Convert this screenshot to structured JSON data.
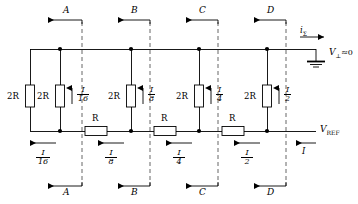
{
  "figure": {
    "type": "circuit-schematic",
    "name": "R-2R ladder network",
    "background": "#ffffff",
    "line_color": "#000000",
    "dashed_color": "#666666"
  },
  "rails": {
    "top": {
      "name": "virtual-ground-rail",
      "label": "V",
      "label_sub": "⊥",
      "label_tail": "≈0",
      "full_label": "V⊥ ≈ 0"
    },
    "bottom": {
      "name": "reference-rail",
      "label": "V",
      "label_sub": "REF",
      "full_label": "V REF"
    }
  },
  "output": {
    "current_symbol": "i",
    "current_sub": "Σ",
    "full": "iΣ",
    "direction": "right"
  },
  "termination": {
    "label": "2R"
  },
  "branches": [
    {
      "switch": "A",
      "resistor": "2R",
      "current_num": "I",
      "current_den": "16",
      "rail_current_num": "I",
      "rail_den": "16",
      "series_resistor": "R"
    },
    {
      "switch": "B",
      "resistor": "2R",
      "current_num": "I",
      "current_den": "8",
      "rail_current_num": "I",
      "rail_den": "8",
      "series_resistor": "R"
    },
    {
      "switch": "C",
      "resistor": "2R",
      "current_num": "I",
      "current_den": "4",
      "rail_current_num": "I",
      "rail_den": "4",
      "series_resistor": "R"
    },
    {
      "switch": "D",
      "resistor": "2R",
      "current_num": "I",
      "current_den": "2",
      "rail_current_num": "I",
      "rail_den": "2",
      "series_resistor": null
    }
  ],
  "source_current": {
    "label": "I",
    "direction": "left"
  },
  "top_switch_labels": [
    "A",
    "B",
    "C",
    "D"
  ],
  "bottom_switch_labels": [
    "A",
    "B",
    "C",
    "D"
  ]
}
